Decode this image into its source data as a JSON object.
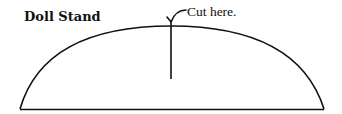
{
  "title": "Doll Stand",
  "annotation": "Cut here.",
  "colors": {
    "stroke": "#111111",
    "background": "#ffffff"
  }
}
